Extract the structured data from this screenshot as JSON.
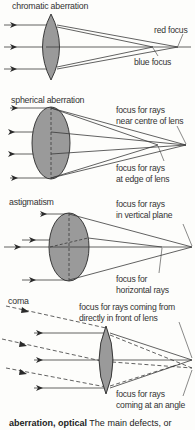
{
  "panels": [
    {
      "id": "chromatic",
      "title": "chromatic aberration",
      "labels": [
        "red focus",
        "blue focus"
      ]
    },
    {
      "id": "spherical",
      "title": "spherical aberration",
      "labels": [
        "focus for rays near centre of lens",
        "focus for rays at edge of lens"
      ],
      "label_lines": [
        [
          "focus for rays",
          "near centre of lens"
        ],
        [
          "focus for rays",
          "at edge of lens"
        ]
      ]
    },
    {
      "id": "astigmatism",
      "title": "astigmatism",
      "labels": [
        "focus for rays in vertical plane",
        "focus for horizontal rays"
      ],
      "label_lines": [
        [
          "focus for rays",
          "in vertical plane"
        ],
        [
          "focus for",
          "horizontal rays"
        ]
      ]
    },
    {
      "id": "coma",
      "title": "coma",
      "labels": [
        "focus for rays coming from directly in front of lens",
        "focus for rays coming at an angle"
      ],
      "label_lines": [
        [
          "focus for rays coming from",
          "directly in front of lens"
        ],
        [
          "focus for rays",
          "coming at an angle"
        ]
      ]
    }
  ],
  "caption": {
    "term": "aberration, optical",
    "text": " The main defects, or"
  },
  "colors": {
    "lens_fill": "#9a9a9a",
    "line": "#3a3a3a",
    "background": "#fdfdfb"
  }
}
